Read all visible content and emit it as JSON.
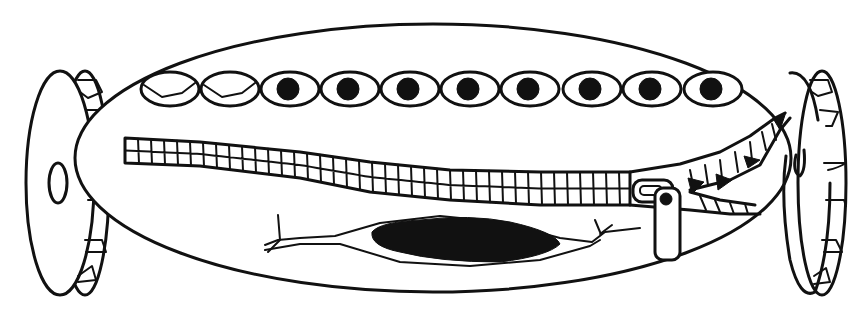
{
  "diagram": {
    "title": "",
    "colors": {
      "stroke": "#111111",
      "fill_dark": "#111111",
      "background": "#ffffff"
    },
    "body": {
      "cx": 433,
      "cy": 158,
      "rx": 358,
      "ry": 134
    },
    "eyes": {
      "cy": 89,
      "rx": 29,
      "ry": 17,
      "pupil_r": 11,
      "items": [
        {
          "cx": 170,
          "state": "closed"
        },
        {
          "cx": 230,
          "state": "closed"
        },
        {
          "cx": 290,
          "state": "open"
        },
        {
          "cx": 350,
          "state": "open"
        },
        {
          "cx": 410,
          "state": "open"
        },
        {
          "cx": 470,
          "state": "open"
        },
        {
          "cx": 530,
          "state": "open"
        },
        {
          "cx": 592,
          "state": "open"
        },
        {
          "cx": 652,
          "state": "open"
        },
        {
          "cx": 713,
          "state": "open"
        }
      ]
    },
    "rollers": [
      {
        "side": "left",
        "disc": {
          "cx": 60,
          "cy": 183,
          "rx": 34,
          "ry": 112
        },
        "rim": {
          "cx": 85,
          "cy": 183,
          "rx": 24,
          "ry": 112
        },
        "hub": {
          "cx": 58,
          "cy": 183,
          "rx": 9,
          "ry": 20
        }
      },
      {
        "side": "right",
        "disc": {
          "cx": 800,
          "cy": 183,
          "rx": 34,
          "ry": 112
        },
        "rim": {
          "cx": 822,
          "cy": 183,
          "rx": 24,
          "ry": 112
        }
      }
    ],
    "zipper": {
      "track_top": [
        [
          125,
          138
        ],
        [
          200,
          142
        ],
        [
          300,
          152
        ],
        [
          370,
          162
        ],
        [
          450,
          170
        ],
        [
          540,
          172
        ],
        [
          630,
          172
        ]
      ],
      "track_bottom": [
        [
          125,
          163
        ],
        [
          200,
          166
        ],
        [
          300,
          178
        ],
        [
          370,
          192
        ],
        [
          450,
          200
        ],
        [
          540,
          205
        ],
        [
          630,
          205
        ]
      ],
      "slider": {
        "x": 655,
        "y": 185,
        "w": 25,
        "h": 75
      },
      "teeth_opening_tip": [
        785,
        115
      ]
    },
    "lens": {
      "outer": {
        "cx": 460,
        "cy": 240,
        "rx": 130,
        "ry": 28
      },
      "inner": {
        "cx": 465,
        "cy": 240,
        "rx": 100,
        "ry": 20
      }
    }
  }
}
